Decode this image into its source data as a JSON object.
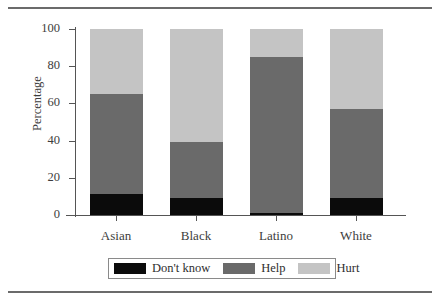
{
  "chart_data": {
    "type": "bar",
    "subtype": "stacked-percentage",
    "title": "",
    "xlabel": "",
    "ylabel": "Percentage",
    "ylim": [
      0,
      100
    ],
    "yticks": [
      0,
      20,
      40,
      60,
      80,
      100
    ],
    "grid": false,
    "legend_position": "bottom",
    "stacked_total": 100,
    "categories": [
      "Asian",
      "Black",
      "Latino",
      "White"
    ],
    "series": [
      {
        "name": "Don't know",
        "color": "#0b0b0b",
        "values": [
          11.5,
          9.0,
          1.0,
          9.0
        ]
      },
      {
        "name": "Help",
        "color": "#6a6a6a",
        "values": [
          53.5,
          30.5,
          84.0,
          48.0
        ]
      },
      {
        "name": "Hurt",
        "color": "#c4c4c4",
        "values": [
          35.0,
          60.5,
          15.0,
          43.0
        ]
      }
    ],
    "cumulative_tops": {
      "Asian": {
        "dont_know": 11.5,
        "help": 65.0,
        "hurt": 100
      },
      "Black": {
        "dont_know": 9.0,
        "help": 39.5,
        "hurt": 100
      },
      "Latino": {
        "dont_know": 1.0,
        "help": 85.0,
        "hurt": 100
      },
      "White": {
        "dont_know": 9.0,
        "help": 57.0,
        "hurt": 100
      }
    }
  },
  "legend": {
    "items": [
      {
        "label": "Don't know",
        "color": "#0b0b0b"
      },
      {
        "label": "Help",
        "color": "#6a6a6a"
      },
      {
        "label": "Hurt",
        "color": "#c4c4c4"
      }
    ]
  },
  "axis": {
    "y_title": "Percentage",
    "y_tick_labels": [
      "0",
      "20",
      "40",
      "60",
      "80",
      "100"
    ],
    "x_tick_labels": [
      "Asian",
      "Black",
      "Latino",
      "White"
    ]
  },
  "colors": {
    "dont_know": "#0b0b0b",
    "help": "#6a6a6a",
    "hurt": "#c4c4c4",
    "axis": "#555555",
    "rule": "#6b6b6b",
    "text": "#3d3d3d",
    "background": "#ffffff"
  }
}
